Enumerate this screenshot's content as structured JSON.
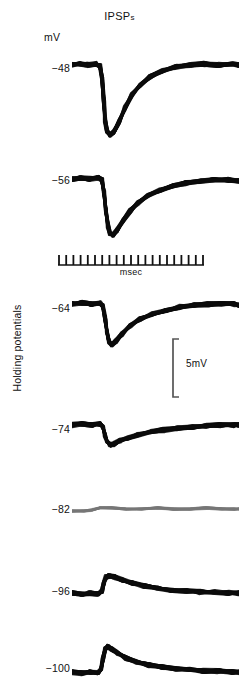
{
  "figure": {
    "title_main": "IPSP",
    "title_sub": "s",
    "units_label": "mV",
    "y_axis_label": "Holding potentials",
    "background_color": "#ffffff",
    "trace_color": "#0b0b0b",
    "reversal_trace_color": "#767676"
  },
  "time_scale": {
    "label": "msec",
    "tick_count": 21,
    "bar_left_px": 58,
    "bar_width_px": 146,
    "color": "#111111"
  },
  "voltage_scale": {
    "label": "5mV",
    "bar_height_px": 58,
    "color": "#555555"
  },
  "chart_data": {
    "type": "line",
    "title": "IPSPs",
    "xlabel": "msec",
    "ylabel": "Holding potentials (mV)",
    "legend_position": "none",
    "grid": false,
    "x_scalebar": {
      "label": "msec",
      "ticks": 21
    },
    "y_scalebar": {
      "label": "5mV",
      "value": 5,
      "units": "mV"
    },
    "series": [
      {
        "name": "-48",
        "holding_potential_mV": -48,
        "label": "−48",
        "color": "#0b0b0b",
        "row_top_px": 48,
        "row_height_px": 100,
        "label_top_px": 62,
        "peak_direction": "hyperpolarizing",
        "peak_amplitude_mV": -13.0,
        "polyline": "0,17 8,16 16,17 24,16 28,18 30,30 32,55 33,72 35,83 38,87 42,84 47,74 53,60 60,47 68,37 78,29 90,23 104,19 118,17 132,16 146,17 160,16 167,17"
      },
      {
        "name": "-56",
        "holding_potential_mV": -56,
        "label": "−56",
        "color": "#0b0b0b",
        "row_top_px": 166,
        "row_height_px": 84,
        "label_top_px": 174,
        "peak_direction": "hyperpolarizing",
        "peak_amplitude_mV": -9.5,
        "polyline": "0,13 9,12 18,13 26,12 30,14 32,26 34,46 36,60 38,67 41,69 45,64 51,55 58,45 66,37 76,30 88,24 100,20 114,17 128,15 142,14 156,14 167,15"
      },
      {
        "name": "-64",
        "holding_potential_mV": -64,
        "label": "−64",
        "color": "#0b0b0b",
        "row_top_px": 292,
        "row_height_px": 70,
        "label_top_px": 302,
        "peak_direction": "hyperpolarizing",
        "peak_amplitude_mV": -7.0,
        "polyline": "0,12 10,11 20,12 28,11 31,14 33,26 35,40 37,50 40,53 44,49 50,42 58,34 68,27 80,22 94,18 108,15 122,13 136,12 150,12 162,12 167,13"
      },
      {
        "name": "-74",
        "holding_potential_mV": -74,
        "label": "−74",
        "color": "#0b0b0b",
        "row_top_px": 415,
        "row_height_px": 54,
        "label_top_px": 423,
        "peak_direction": "hyperpolarizing",
        "peak_amplitude_mV": -3.0,
        "polyline": "0,10 10,9 20,10 28,9 31,12 33,20 35,27 38,30 42,29 48,26 56,23 66,20 78,17 92,15 106,13 120,12 134,11 148,10 162,10 167,10"
      },
      {
        "name": "-82",
        "holding_potential_mV": -82,
        "label": "−82",
        "color": "#767676",
        "row_top_px": 498,
        "row_height_px": 26,
        "label_top_px": 503,
        "peak_direction": "none",
        "peak_amplitude_mV": 0.0,
        "is_reversal": true,
        "polyline": "0,13 12,13 20,12 28,10 40,10 54,11 70,11 86,10 102,11 118,11 134,10 150,11 162,11 167,11"
      },
      {
        "name": "-96",
        "holding_potential_mV": -96,
        "label": "−96",
        "color": "#0b0b0b",
        "row_top_px": 563,
        "row_height_px": 44,
        "label_top_px": 585,
        "peak_direction": "depolarizing",
        "peak_amplitude_mV": 3.5,
        "polyline": "0,30 10,31 18,30 26,31 30,28 32,20 34,14 37,13 42,14 50,17 60,20 72,23 86,25 100,27 114,28 128,29 142,29 156,30 167,30"
      },
      {
        "name": "-100",
        "holding_potential_mV": -100,
        "label": "−100",
        "color": "#0b0b0b",
        "row_top_px": 636,
        "row_height_px": 54,
        "label_top_px": 662,
        "peak_direction": "depolarizing",
        "peak_amplitude_mV": 5.0,
        "polyline": "0,36 10,37 18,36 26,37 29,33 31,22 33,13 36,11 40,13 46,17 54,22 64,26 76,29 90,31 104,33 118,34 132,35 146,35 160,36 167,36"
      }
    ]
  }
}
